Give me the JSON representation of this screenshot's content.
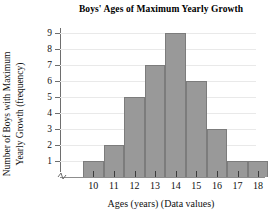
{
  "chart_data": {
    "type": "bar",
    "title": "Boys' Ages of Maximum Yearly Growth",
    "xlabel": "Ages (years) (Data values)",
    "ylabel": "Number of Boys with Maximum\nYearly Growth (frequency)",
    "categories": [
      "10",
      "11",
      "12",
      "13",
      "14",
      "15",
      "16",
      "17",
      "18"
    ],
    "values": [
      1,
      2,
      5,
      7,
      9,
      6,
      3,
      1,
      1
    ],
    "ylim": [
      0,
      9
    ],
    "yticks": [
      "1",
      "2",
      "3",
      "4",
      "5",
      "6",
      "7",
      "8",
      "9"
    ],
    "xticks": [
      "10",
      "11",
      "12",
      "13",
      "14",
      "15",
      "16",
      "17",
      "18"
    ],
    "grid": true,
    "legend": "none",
    "bar_color": "#999999",
    "bar_edge_color": "#7c7c7c",
    "axis_color": "#6e6e6e",
    "gridline_color": "#e9e9e9",
    "text_color": "#111111",
    "axis_break": "y-axis-break-zigzag"
  }
}
